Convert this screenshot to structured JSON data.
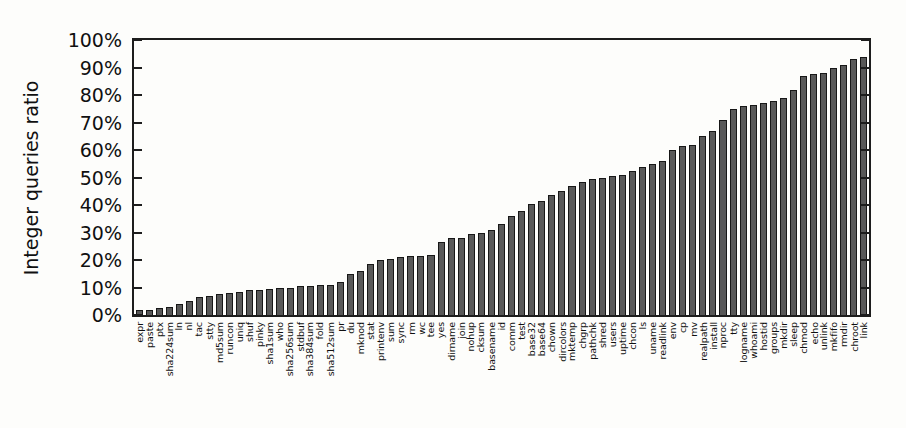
{
  "chart_data": {
    "type": "bar",
    "title": "",
    "xlabel": "",
    "ylabel": "Integer queries ratio",
    "ylim": [
      0,
      100
    ],
    "ytick_step": 10,
    "ytick_labels": [
      "0%",
      "10%",
      "20%",
      "30%",
      "40%",
      "50%",
      "60%",
      "70%",
      "80%",
      "90%",
      "100%"
    ],
    "legend": "none",
    "grid": "off",
    "bar_color": "#585858",
    "bar_border_color": "#171717",
    "categories": [
      "expr",
      "paste",
      "ptx",
      "sha224sum",
      "ln",
      "nl",
      "tac",
      "stty",
      "md5sum",
      "runcon",
      "uniq",
      "shuf",
      "pinky",
      "sha1sum",
      "who",
      "sha256sum",
      "stdbuf",
      "sha384sum",
      "fold",
      "sha512sum",
      "pr",
      "du",
      "mknod",
      "stat",
      "printenv",
      "sum",
      "sync",
      "rm",
      "wc",
      "tee",
      "yes",
      "dirname",
      "join",
      "nohup",
      "cksum",
      "basename",
      "id",
      "comm",
      "test",
      "base32",
      "base64",
      "chown",
      "dircolors",
      "mktemp",
      "chgrp",
      "pathchk",
      "shred",
      "users",
      "uptime",
      "chcon",
      "ls",
      "uname",
      "readlink",
      "env",
      "cp",
      "mv",
      "realpath",
      "install",
      "nproc",
      "tty",
      "logname",
      "whoami",
      "hostid",
      "groups",
      "mkdir",
      "sleep",
      "chmod",
      "echo",
      "unlink",
      "mkfifo",
      "rmdir",
      "chroot",
      "link"
    ],
    "values": [
      2,
      2,
      2.5,
      3,
      4,
      5,
      6.5,
      7,
      7.5,
      8,
      8.5,
      9,
      9,
      9.5,
      10,
      10,
      10.5,
      10.5,
      11,
      11,
      12,
      15,
      16,
      18.5,
      20,
      20.5,
      21,
      21.5,
      21.5,
      22,
      26.5,
      28,
      28,
      29.5,
      30,
      31,
      33,
      36,
      38,
      40.5,
      41.5,
      43.5,
      45,
      47,
      48.5,
      49.5,
      50,
      50.5,
      51,
      52.5,
      54,
      55,
      56,
      60,
      61.5,
      62,
      65,
      67,
      71,
      75,
      76,
      76.5,
      77,
      78,
      79,
      82,
      87,
      87.5,
      88,
      90,
      91,
      93,
      94
    ]
  }
}
